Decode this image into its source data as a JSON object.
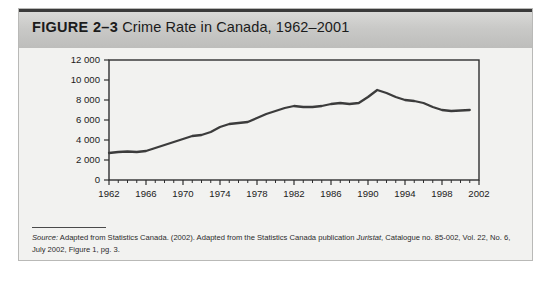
{
  "figure": {
    "label": "FIGURE 2–3",
    "title": "Crime Rate in Canada, 1962–2001"
  },
  "source": {
    "label": "Source:",
    "text": " Adapted from Statistics Canada. (2002). Adapted from the Statistics Canada publication ",
    "publication": "Juristat",
    "text_after": ", Catalogue no. 85-002, Vol. 22, No. 6, July 2002, Figure 1, pg. 3."
  },
  "chart_data": {
    "type": "line",
    "title": "Crime Rate in Canada, 1962–2001",
    "xlabel": "",
    "ylabel": "",
    "xlim": [
      1962,
      2002
    ],
    "ylim": [
      0,
      12000
    ],
    "grid": false,
    "legend": null,
    "line_color": "#3c3c3c",
    "xticks": [
      1962,
      1966,
      1970,
      1974,
      1978,
      1982,
      1986,
      1990,
      1994,
      1998,
      2002
    ],
    "xtick_labels": [
      "1962",
      "1966",
      "1970",
      "1974",
      "1978",
      "1982",
      "1986",
      "1990",
      "1994",
      "1998",
      "2002"
    ],
    "yticks": [
      0,
      2000,
      4000,
      6000,
      8000,
      10000,
      12000
    ],
    "ytick_labels": [
      "0",
      "2 000",
      "4 000",
      "6 000",
      "8 000",
      "10 000",
      "12 000"
    ],
    "x": [
      1962,
      1963,
      1964,
      1965,
      1966,
      1967,
      1968,
      1969,
      1970,
      1971,
      1972,
      1973,
      1974,
      1975,
      1976,
      1977,
      1978,
      1979,
      1980,
      1981,
      1982,
      1983,
      1984,
      1985,
      1986,
      1987,
      1988,
      1989,
      1990,
      1991,
      1992,
      1993,
      1994,
      1995,
      1996,
      1997,
      1998,
      1999,
      2000,
      2001
    ],
    "values": [
      2700,
      2800,
      2850,
      2800,
      2900,
      3200,
      3500,
      3800,
      4100,
      4400,
      4500,
      4800,
      5300,
      5600,
      5700,
      5800,
      6200,
      6600,
      6900,
      7200,
      7400,
      7300,
      7300,
      7400,
      7600,
      7700,
      7600,
      7700,
      8300,
      9000,
      8700,
      8300,
      8000,
      7900,
      7700,
      7300,
      7000,
      6900,
      6950,
      7000
    ],
    "annotations": []
  }
}
